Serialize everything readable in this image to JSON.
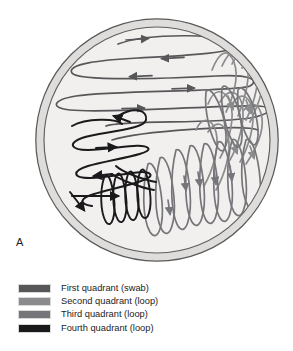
{
  "figure": {
    "panel_label": "A",
    "title_alt": "Streak plate method on agar petri dish",
    "dish": {
      "center_x": 157,
      "center_y": 140,
      "radius_outer": 122,
      "radius_rim_inner": 113,
      "fill_color": "#f1f0ee",
      "rim_color": "#dcdbd8",
      "outline_color": "#5a5a5a",
      "background_color": "#ffffff"
    }
  },
  "legend": {
    "items": [
      {
        "label": "First quadrant (swab)",
        "color": "#57575a",
        "swatch_name": "first-quadrant-swatch"
      },
      {
        "label": "Second quadrant (loop)",
        "color": "#8b8b8e",
        "swatch_name": "second-quadrant-swatch"
      },
      {
        "label": "Third quadrant (loop)",
        "color": "#76767a",
        "swatch_name": "third-quadrant-swatch"
      },
      {
        "label": "Fourth quadrant (loop)",
        "color": "#1a1a1c",
        "swatch_name": "fourth-quadrant-swatch"
      }
    ]
  },
  "quadrants": {
    "first": {
      "name": "First quadrant (swab)",
      "color": "#57575a",
      "stroke_width": 1.7,
      "region": "upper portion of dish",
      "pattern": "wide flattened horizontal zigzag loops",
      "arrow_count": 5
    },
    "second": {
      "name": "Second quadrant (loop)",
      "color": "#8b8b8e",
      "stroke_width": 1.7,
      "region": "right side of dish",
      "pattern": "steep narrow diagonal loops crossing first quadrant",
      "arrow_count": 4
    },
    "third": {
      "name": "Third quadrant (loop)",
      "color": "#76767a",
      "stroke_width": 1.7,
      "region": "lower right of dish",
      "pattern": "dense near-vertical elongated loops",
      "arrow_count": 5
    },
    "fourth": {
      "name": "Fourth quadrant (loop)",
      "color": "#1a1a1c",
      "stroke_width": 2.0,
      "region": "left and lower left of dish",
      "pattern": "broad horizontal loops trailing into narrow crossing loops",
      "arrow_count": 5
    }
  }
}
